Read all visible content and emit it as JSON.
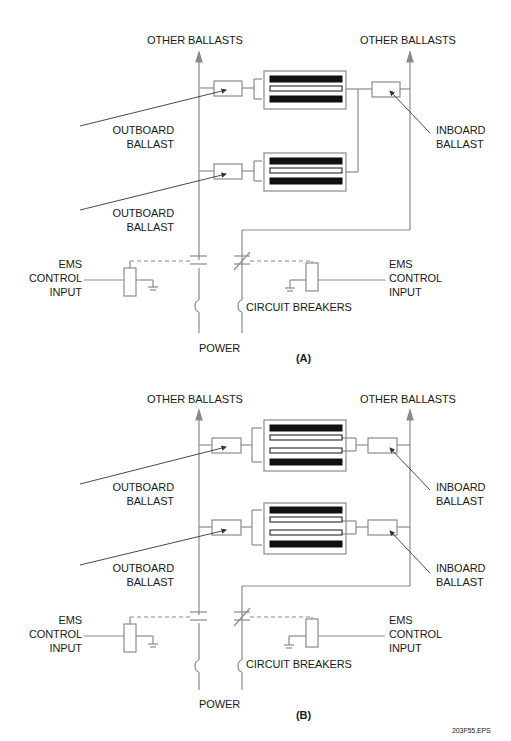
{
  "diagrams": [
    {
      "id": "A",
      "caption": "(A)",
      "labels": {
        "other_ballasts_left": "OTHER BALLASTS",
        "other_ballasts_right": "OTHER BALLASTS",
        "outboard_ballast_1": [
          "OUTBOARD",
          "BALLAST"
        ],
        "outboard_ballast_2": [
          "OUTBOARD",
          "BALLAST"
        ],
        "inboard_ballast_1": [
          "INBOARD",
          "BALLAST"
        ],
        "ems_left": [
          "EMS",
          "CONTROL",
          "INPUT"
        ],
        "ems_right": [
          "EMS",
          "CONTROL",
          "INPUT"
        ],
        "circuit_breakers": "CIRCUIT BREAKERS",
        "power": "POWER"
      },
      "fixtures": [
        {
          "lamps": [
            "filled",
            "hollow",
            "filled"
          ]
        },
        {
          "lamps": [
            "filled",
            "hollow",
            "filled"
          ]
        }
      ]
    },
    {
      "id": "B",
      "caption": "(B)",
      "labels": {
        "other_ballasts_left": "OTHER BALLASTS",
        "other_ballasts_right": "OTHER BALLASTS",
        "outboard_ballast_1": [
          "OUTBOARD",
          "BALLAST"
        ],
        "outboard_ballast_2": [
          "OUTBOARD",
          "BALLAST"
        ],
        "inboard_ballast_1": [
          "INBOARD",
          "BALLAST"
        ],
        "inboard_ballast_2": [
          "INBOARD",
          "BALLAST"
        ],
        "ems_left": [
          "EMS",
          "CONTROL",
          "INPUT"
        ],
        "ems_right": [
          "EMS",
          "CONTROL",
          "INPUT"
        ],
        "circuit_breakers": "CIRCUIT BREAKERS",
        "power": "POWER"
      },
      "fixtures": [
        {
          "lamps": [
            "filled",
            "hollow",
            "hollow",
            "filled"
          ]
        },
        {
          "lamps": [
            "filled",
            "hollow",
            "hollow",
            "filled"
          ]
        }
      ]
    }
  ],
  "file_id": "203F55.EPS",
  "colors": {
    "line": "#8a8a8a",
    "lamp_fill": "#111111",
    "text": "#1a1a1a"
  }
}
